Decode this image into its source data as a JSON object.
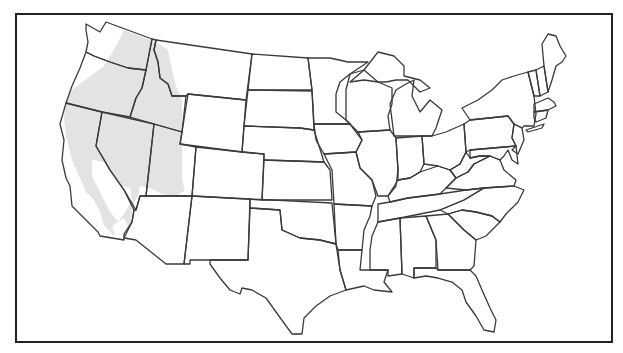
{
  "figure": {
    "type": "choropleth-outline-map",
    "region": "Contiguous United States",
    "frame": {
      "x": 16,
      "y": 14,
      "width": 596,
      "height": 328
    },
    "colors": {
      "background": "#ffffff",
      "outline": "#3a3a3a",
      "frame": "#222222",
      "shaded_region": "#e3e3e3"
    },
    "shaded_region": {
      "label": "",
      "states_covered": [
        "Washington (east)",
        "Oregon",
        "Idaho",
        "Montana (west)",
        "Nevada",
        "California (except Central Valley)",
        "Utah (west)"
      ]
    },
    "states": [
      "Washington",
      "Oregon",
      "California",
      "Idaho",
      "Nevada",
      "Utah",
      "Arizona",
      "Montana",
      "Wyoming",
      "Colorado",
      "New Mexico",
      "North Dakota",
      "South Dakota",
      "Nebraska",
      "Kansas",
      "Oklahoma",
      "Texas",
      "Minnesota",
      "Iowa",
      "Missouri",
      "Arkansas",
      "Louisiana",
      "Wisconsin",
      "Illinois",
      "Michigan",
      "Indiana",
      "Ohio",
      "Kentucky",
      "Tennessee",
      "Mississippi",
      "Alabama",
      "Georgia",
      "Florida",
      "South Carolina",
      "North Carolina",
      "Virginia",
      "West Virginia",
      "Maryland",
      "Delaware",
      "Pennsylvania",
      "New Jersey",
      "New York",
      "Connecticut",
      "Rhode Island",
      "Massachusetts",
      "Vermont",
      "New Hampshire",
      "Maine"
    ],
    "text_labels": []
  }
}
